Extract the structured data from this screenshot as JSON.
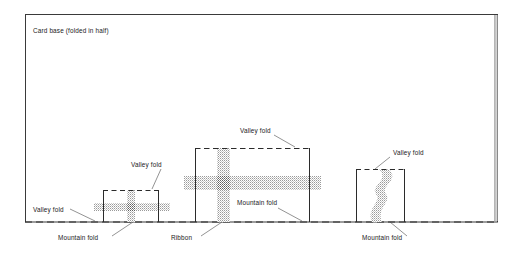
{
  "figure": {
    "title": "Card base (folded in half)",
    "background_color": "#ffffff",
    "ink_color": "#1a1a1a",
    "ribbon_color": "#b3b3b3",
    "card_frame": {
      "x": 25,
      "y": 14,
      "width": 473,
      "height": 208
    },
    "baseline": {
      "y": 222,
      "x_start": 25,
      "x_end": 498,
      "style": "dashed"
    },
    "labels": {
      "valley_fold": "Valley fold",
      "mountain_fold": "Mountain fold",
      "ribbon": "Ribbon"
    },
    "pop_ups": [
      {
        "name": "small-pop-up",
        "box": {
          "x": 103,
          "y": 190,
          "width": 56,
          "height": 32
        },
        "ribbon_style": "cross",
        "labels": [
          "Valley fold",
          "Mountain fold"
        ]
      },
      {
        "name": "large-pop-up",
        "box": {
          "x": 195,
          "y": 148,
          "width": 115,
          "height": 74
        },
        "ribbon_style": "cross",
        "labels": [
          "Valley fold",
          "Mountain fold",
          "Ribbon"
        ]
      },
      {
        "name": "wavy-pop-up",
        "box": {
          "x": 356,
          "y": 169,
          "width": 49,
          "height": 53
        },
        "ribbon_style": "wavy-vertical",
        "labels": [
          "Valley fold",
          "Mountain fold"
        ]
      }
    ],
    "annotations": [
      {
        "id": "valley-fold-baseline-left",
        "text": "Valley fold",
        "x": 33,
        "y": 212
      },
      {
        "id": "mountain-fold-left",
        "text": "Mountain fold",
        "x": 58,
        "y": 240
      },
      {
        "id": "valley-fold-small-box",
        "text": "Valley fold",
        "x": 131,
        "y": 167
      },
      {
        "id": "ribbon-middle",
        "text": "Ribbon",
        "x": 171,
        "y": 240
      },
      {
        "id": "valley-fold-large-box",
        "text": "Valley fold",
        "x": 240,
        "y": 133
      },
      {
        "id": "mountain-fold-middle",
        "text": "Mountain fold",
        "x": 237,
        "y": 205
      },
      {
        "id": "valley-fold-wavy-box",
        "text": "Valley fold",
        "x": 393,
        "y": 155
      },
      {
        "id": "mountain-fold-right",
        "text": "Mountain fold",
        "x": 362,
        "y": 240
      }
    ]
  }
}
